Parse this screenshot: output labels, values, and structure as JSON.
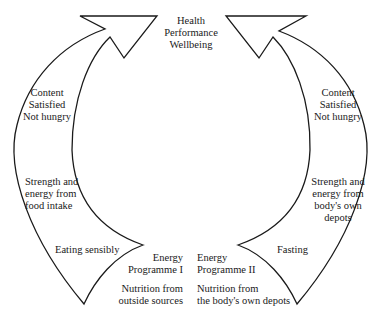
{
  "diagram": {
    "center_top": {
      "lines": [
        "Health",
        "Performance",
        "Wellbeing"
      ]
    },
    "left_cycle": {
      "name": "Energy Programme I",
      "upper_label": [
        "Content",
        "Satisfied",
        "Not hungry"
      ],
      "middle_label": [
        "Strength and",
        "energy from",
        "food intake"
      ],
      "lower_label": "Eating sensibly",
      "programme_label": [
        "Energy",
        "Programme I"
      ],
      "source_label": [
        "Nutrition from",
        "outside sources"
      ]
    },
    "right_cycle": {
      "name": "Energy Programme II",
      "upper_label": [
        "Content",
        "Satisfied",
        "Not hungry"
      ],
      "middle_label": [
        "Strength and",
        "energy from",
        "body's own",
        "depots"
      ],
      "lower_label": "Fasting",
      "programme_label": [
        "Energy",
        "Programme II"
      ],
      "source_label": [
        "Nutrition from",
        "the body's own depots"
      ]
    },
    "colors": {
      "stroke": "#1a1a1a",
      "background": "#ffffff"
    }
  }
}
